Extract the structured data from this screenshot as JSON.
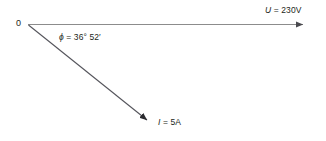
{
  "diagram": {
    "type": "phasor-diagram",
    "background_color": "#ffffff",
    "origin_label": "0",
    "labels": {
      "voltage_symbol": "U",
      "voltage_value": " = 230V",
      "voltage_full": "U = 230V",
      "current_symbol": "I",
      "current_value": " = 5A",
      "current_full": "I = 5A",
      "angle_symbol": "ϕ",
      "angle_value": " = 36° 52′",
      "angle_full": "ϕ = 36° 52′"
    },
    "vectors": [
      {
        "name": "voltage-phasor",
        "label": "U = 230V",
        "magnitude": "230V",
        "direction_deg": 0,
        "color": "#8c8c8c"
      },
      {
        "name": "current-phasor",
        "label": "I = 5A",
        "magnitude": "5A",
        "direction_deg": -36.87,
        "color": "#3f3f46"
      }
    ],
    "angle": {
      "name": "phase-angle",
      "degrees": 36,
      "minutes": 52,
      "between": [
        "voltage-phasor",
        "current-phasor"
      ]
    },
    "colors": {
      "text": "#231f20",
      "voltage_line": "#8c8c8c",
      "current_line": "#3f3f46"
    }
  }
}
